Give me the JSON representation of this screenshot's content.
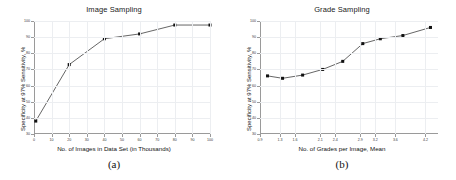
{
  "figure": {
    "subcaption_a": "(a)",
    "subcaption_b": "(b)",
    "line_color": "#555555",
    "marker_color": "#111111",
    "grid_color": "#eceef1"
  },
  "chart_data": [
    {
      "type": "line",
      "title": "Image Sampling",
      "xlabel": "No. of Images in Data Set (in Thousands)",
      "ylabel": "Specificity at 97% Sensitivity, %",
      "xlim": [
        0,
        100
      ],
      "ylim": [
        30,
        100
      ],
      "grid": true,
      "legend": "none",
      "xticks": [
        0,
        10,
        20,
        30,
        40,
        50,
        60,
        70,
        80,
        90,
        100
      ],
      "xticklabels": [
        "0",
        "10",
        "20",
        "30",
        "40",
        "50",
        "60",
        "70",
        "80",
        "90",
        "100"
      ],
      "yticks": [
        30,
        40,
        50,
        60,
        70,
        80,
        90,
        100
      ],
      "yticklabels": [
        "30",
        "40",
        "50",
        "60",
        "70",
        "80",
        "90",
        "100"
      ],
      "x": [
        1,
        20,
        40,
        60,
        80,
        100
      ],
      "values": [
        38,
        73,
        89,
        92,
        97.5,
        97.5
      ],
      "series_name": "Specificity"
    },
    {
      "type": "line",
      "title": "Grade Sampling",
      "xlabel": "No. of Grades per Image, Mean",
      "ylabel": "Specificity at 97% Sensitivity, %",
      "xlim": [
        0.9,
        4.45
      ],
      "ylim": [
        30,
        100
      ],
      "grid": true,
      "legend": "none",
      "xticks": [
        0.9,
        1.3,
        1.6,
        2.1,
        2.4,
        2.9,
        3.2,
        3.6,
        4.2
      ],
      "xticklabels": [
        "0.9",
        "1.3",
        "1.6",
        "2.1",
        "2.4",
        "2.9",
        "3.2",
        "3.6",
        "4.2"
      ],
      "yticks": [
        30,
        40,
        50,
        60,
        70,
        80,
        90,
        100
      ],
      "yticklabels": [
        "30",
        "40",
        "50",
        "60",
        "70",
        "80",
        "90",
        "100"
      ],
      "x": [
        1.05,
        1.35,
        1.75,
        2.15,
        2.55,
        2.95,
        3.3,
        3.75,
        4.3
      ],
      "values": [
        66,
        64.5,
        66.5,
        70,
        75,
        86,
        89,
        91,
        96
      ],
      "series_name": "Specificity"
    }
  ]
}
